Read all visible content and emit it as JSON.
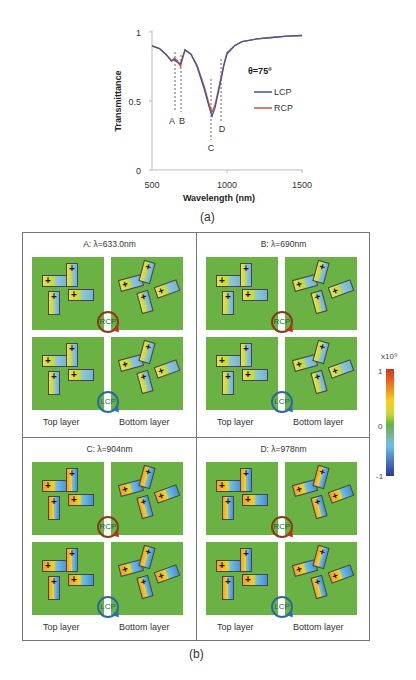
{
  "figure": {
    "caption_a": "(a)",
    "caption_b": "(b)"
  },
  "chart_data": {
    "type": "line",
    "title": "",
    "xlabel": "Wavelength (nm)",
    "ylabel": "Transmittance",
    "xlim": [
      500,
      1500
    ],
    "ylim": [
      0,
      1
    ],
    "xticks": [
      500,
      1000,
      1500
    ],
    "yticks": [
      0,
      0.5,
      1
    ],
    "grid": false,
    "legend": {
      "title": "θ=75º",
      "entries": [
        "LCP",
        "RCP"
      ],
      "position": "right-inside"
    },
    "series": [
      {
        "name": "LCP",
        "color": "#3a5a9a",
        "x": [
          500,
          550,
          600,
          630,
          650,
          670,
          690,
          720,
          760,
          800,
          850,
          880,
          900,
          920,
          950,
          980,
          1000,
          1050,
          1100,
          1200,
          1300,
          1400,
          1500
        ],
        "y": [
          0.9,
          0.88,
          0.83,
          0.79,
          0.8,
          0.78,
          0.77,
          0.87,
          0.84,
          0.75,
          0.58,
          0.46,
          0.39,
          0.45,
          0.6,
          0.76,
          0.84,
          0.9,
          0.93,
          0.95,
          0.96,
          0.97,
          0.975
        ]
      },
      {
        "name": "RCP",
        "color": "#e04a3a",
        "x": [
          500,
          550,
          600,
          630,
          650,
          670,
          690,
          720,
          760,
          800,
          850,
          880,
          900,
          920,
          950,
          980,
          1000,
          1050,
          1100,
          1200,
          1300,
          1400,
          1500
        ],
        "y": [
          0.9,
          0.88,
          0.83,
          0.79,
          0.81,
          0.79,
          0.75,
          0.87,
          0.84,
          0.76,
          0.6,
          0.48,
          0.42,
          0.47,
          0.62,
          0.77,
          0.85,
          0.9,
          0.93,
          0.95,
          0.96,
          0.97,
          0.975
        ]
      }
    ],
    "annotations": [
      {
        "label": "A",
        "x": 633
      },
      {
        "label": "B",
        "x": 690
      },
      {
        "label": "C",
        "x": 904
      },
      {
        "label": "D",
        "x": 978
      }
    ]
  },
  "panels": [
    {
      "id": "A",
      "title": "A: λ=633.0nm",
      "top_label": "Top layer",
      "bottom_label": "Bottom layer",
      "rcp": "RCP",
      "lcp": "LCP"
    },
    {
      "id": "B",
      "title": "B: λ=690nm",
      "top_label": "Top layer",
      "bottom_label": "Bottom layer",
      "rcp": "RCP",
      "lcp": "LCP"
    },
    {
      "id": "C",
      "title": "C: λ=904nm",
      "top_label": "Top layer",
      "bottom_label": "Bottom layer",
      "rcp": "RCP",
      "lcp": "LCP"
    },
    {
      "id": "D",
      "title": "D: λ=978nm",
      "top_label": "Top layer",
      "bottom_label": "Bottom layer",
      "rcp": "RCP",
      "lcp": "LCP"
    }
  ],
  "colorbar": {
    "scale": "x10⁹",
    "max": "1",
    "mid": "0",
    "min": "-1"
  }
}
